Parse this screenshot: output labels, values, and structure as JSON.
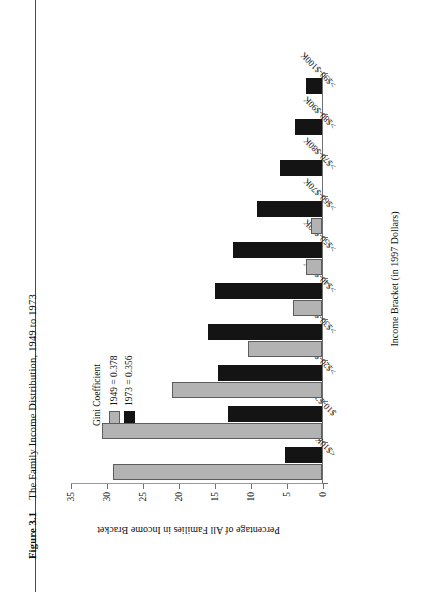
{
  "caption": {
    "label": "Figure 3.1",
    "text": "The Family Income Distribution, 1949 to 1973"
  },
  "legend": {
    "title": "Gini Coefficient",
    "entries": [
      {
        "label": "1949 = 0.378",
        "color": "#b3b3b3"
      },
      {
        "label": "1973 = 0.356",
        "color": "#141414"
      }
    ]
  },
  "chart_data": {
    "type": "bar",
    "title": "The Family Income Distribution, 1949 to 1973",
    "xlabel": "Income Bracket (in 1997 Dollars)",
    "ylabel": "Percentage of All Families in Income Bracket",
    "ylim": [
      0,
      35
    ],
    "yticks": [
      0,
      5,
      10,
      15,
      20,
      25,
      30,
      35
    ],
    "grid": false,
    "legend_position": "upper-right",
    "orientation": "vertical",
    "categories": [
      "<$10K",
      "$10-$20K",
      ">$20-$30K",
      ">$30-$40K",
      ">$40-$50K",
      ">$50-$60K",
      ">$60-$70K",
      ">$70-$80K",
      ">$80-$90K",
      ">$90-$100K"
    ],
    "series": [
      {
        "name": "1949 = 0.378",
        "color": "#b3b3b3",
        "values": [
          29.0,
          30.6,
          20.9,
          10.3,
          4.0,
          2.2,
          1.5,
          0.0,
          0.0,
          0.0
        ]
      },
      {
        "name": "1973 = 0.356",
        "color": "#141414",
        "values": [
          5.2,
          13.1,
          14.4,
          15.9,
          14.9,
          12.4,
          9.0,
          5.9,
          3.7,
          2.2
        ]
      }
    ]
  }
}
